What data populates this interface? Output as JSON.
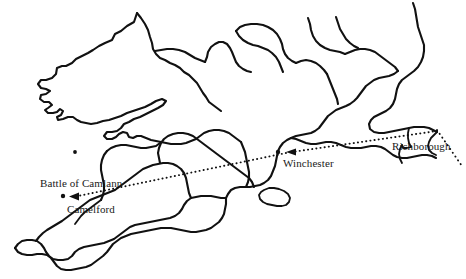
{
  "map": {
    "title": "Map of southern Britain showing route from Richborough to Camelford",
    "background_color": "#ffffff",
    "ink_color": "#111111",
    "width": 466,
    "height": 279,
    "labels": [
      {
        "id": "battle-of-camlann",
        "text": "Battle of Camlann",
        "x": 40,
        "y": 177
      },
      {
        "id": "camelford",
        "text": "Camelford",
        "x": 67,
        "y": 203
      },
      {
        "id": "winchester",
        "text": "Winchester",
        "x": 283,
        "y": 157
      },
      {
        "id": "richborough",
        "text": "Richborough",
        "x": 392,
        "y": 140
      }
    ],
    "places": [
      {
        "id": "camelford-dot",
        "name": "Camelford",
        "x": 63,
        "y": 196
      },
      {
        "id": "winchester-dot",
        "name": "Winchester",
        "x": 278,
        "y": 152
      },
      {
        "id": "unnamed-dot",
        "name": "unnamed-site",
        "x": 75,
        "y": 152
      }
    ],
    "routes": [
      {
        "id": "richborough-to-winchester",
        "from": "Richborough",
        "to": "Winchester",
        "style": "dotted",
        "arrow_at": "Winchester"
      },
      {
        "id": "winchester-to-camelford",
        "from": "Winchester",
        "to": "Camelford",
        "style": "dotted",
        "arrow_at": "Camelford"
      },
      {
        "id": "arrival-from-southeast",
        "from": "offshore-southeast",
        "to": "Richborough",
        "style": "dotted",
        "arrow_at": "none"
      }
    ]
  }
}
